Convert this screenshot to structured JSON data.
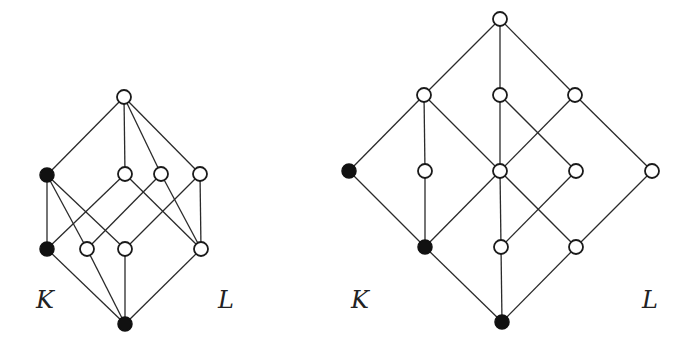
{
  "figure": {
    "node_radius": 7,
    "colors": {
      "edge": "#2a2a2a",
      "open_fill": "#ffffff",
      "filled": "#111111",
      "label": "#222222"
    },
    "diagrams": [
      {
        "id": "left-lattice",
        "nodes": [
          {
            "id": "top",
            "x": 124,
            "y": 97,
            "filled": false
          },
          {
            "id": "m1",
            "x": 47,
            "y": 175,
            "filled": true
          },
          {
            "id": "m2",
            "x": 125,
            "y": 174,
            "filled": false
          },
          {
            "id": "m3",
            "x": 161,
            "y": 174,
            "filled": false
          },
          {
            "id": "m4",
            "x": 200,
            "y": 174,
            "filled": false
          },
          {
            "id": "l1",
            "x": 47,
            "y": 249,
            "filled": true
          },
          {
            "id": "l2",
            "x": 87,
            "y": 249,
            "filled": false
          },
          {
            "id": "l3",
            "x": 125,
            "y": 249,
            "filled": false
          },
          {
            "id": "l4",
            "x": 201,
            "y": 249,
            "filled": false
          },
          {
            "id": "bot",
            "x": 125,
            "y": 324,
            "filled": true
          }
        ],
        "edges": [
          [
            "top",
            "m1"
          ],
          [
            "top",
            "m2"
          ],
          [
            "top",
            "m3"
          ],
          [
            "top",
            "m4"
          ],
          [
            "m1",
            "l1"
          ],
          [
            "m1",
            "l2"
          ],
          [
            "m1",
            "l3"
          ],
          [
            "m2",
            "l1"
          ],
          [
            "m2",
            "l4"
          ],
          [
            "m3",
            "l2"
          ],
          [
            "m3",
            "l4"
          ],
          [
            "m4",
            "l3"
          ],
          [
            "m4",
            "l4"
          ],
          [
            "l1",
            "bot"
          ],
          [
            "l2",
            "bot"
          ],
          [
            "l3",
            "bot"
          ],
          [
            "l4",
            "bot"
          ]
        ],
        "labels": [
          {
            "text": "K",
            "x": 36,
            "y": 288
          },
          {
            "text": "L",
            "x": 218,
            "y": 288
          }
        ]
      },
      {
        "id": "right-lattice",
        "nodes": [
          {
            "id": "top",
            "x": 500,
            "y": 19,
            "filled": false
          },
          {
            "id": "a1",
            "x": 424,
            "y": 95,
            "filled": false
          },
          {
            "id": "a2",
            "x": 500,
            "y": 95,
            "filled": false
          },
          {
            "id": "a3",
            "x": 575,
            "y": 95,
            "filled": false
          },
          {
            "id": "b1",
            "x": 349,
            "y": 171,
            "filled": true
          },
          {
            "id": "b2",
            "x": 425,
            "y": 171,
            "filled": false
          },
          {
            "id": "b3",
            "x": 500,
            "y": 171,
            "filled": false
          },
          {
            "id": "b4",
            "x": 576,
            "y": 171,
            "filled": false
          },
          {
            "id": "b5",
            "x": 652,
            "y": 171,
            "filled": false
          },
          {
            "id": "c1",
            "x": 425,
            "y": 247,
            "filled": true
          },
          {
            "id": "c2",
            "x": 501,
            "y": 247,
            "filled": false
          },
          {
            "id": "c3",
            "x": 576,
            "y": 247,
            "filled": false
          },
          {
            "id": "bot",
            "x": 502,
            "y": 322,
            "filled": true
          }
        ],
        "edges": [
          [
            "top",
            "a1"
          ],
          [
            "top",
            "a2"
          ],
          [
            "top",
            "a3"
          ],
          [
            "a1",
            "b1"
          ],
          [
            "a1",
            "b2"
          ],
          [
            "a1",
            "b3"
          ],
          [
            "a2",
            "b3"
          ],
          [
            "a2",
            "b4"
          ],
          [
            "a3",
            "b3"
          ],
          [
            "a3",
            "b5"
          ],
          [
            "b1",
            "c1"
          ],
          [
            "b2",
            "c1"
          ],
          [
            "b3",
            "c1"
          ],
          [
            "b3",
            "c2"
          ],
          [
            "b3",
            "c3"
          ],
          [
            "b4",
            "c2"
          ],
          [
            "b5",
            "c3"
          ],
          [
            "c1",
            "bot"
          ],
          [
            "c2",
            "bot"
          ],
          [
            "c3",
            "bot"
          ]
        ],
        "labels": [
          {
            "text": "K",
            "x": 351,
            "y": 288
          },
          {
            "text": "L",
            "x": 642,
            "y": 288
          }
        ]
      }
    ]
  }
}
